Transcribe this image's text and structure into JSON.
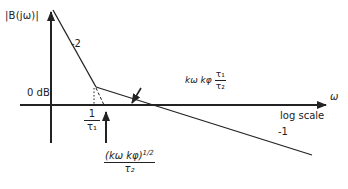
{
  "diagram": {
    "y_axis_label": "|B(jω)|",
    "x_axis_symbol": "ω",
    "x_axis_scale_label": "log scale",
    "zero_db_label": "0 dB",
    "slope_labels": {
      "steep": "-2",
      "shallow": "-1"
    },
    "break_frequency": {
      "numerator": "1",
      "denominator": "τ₁"
    },
    "crossover_frequency_arrow": {
      "numerator": "(k_ω k_φ)^1/2",
      "numerator_base": "(kω kφ)",
      "numerator_exponent": "1/2",
      "denominator": "τ₂"
    },
    "crossing_label": {
      "prefix": "kω kφ",
      "numerator": "τ₁",
      "denominator": "τ₂"
    },
    "colors": {
      "ink": "#222222",
      "background": "#ffffff"
    }
  }
}
